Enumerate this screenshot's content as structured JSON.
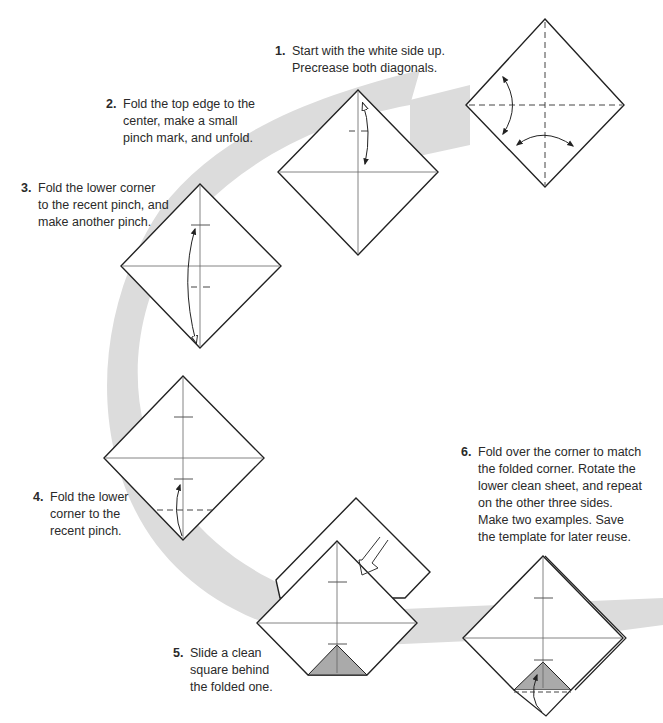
{
  "page": {
    "background": "#ffffff",
    "band_color": "#dcdcdc",
    "line_color": "#222222",
    "crease_color": "#555555",
    "shade_color": "#aaaaaa"
  },
  "steps": [
    {
      "number": "1.",
      "lines": [
        "Start with the white side up.",
        "Precrease both diagonals."
      ]
    },
    {
      "number": "2.",
      "lines": [
        "Fold the top edge to the",
        "center, make a small",
        "pinch mark, and unfold."
      ]
    },
    {
      "number": "3.",
      "lines": [
        "Fold the lower corner",
        "to the recent pinch, and",
        "make another pinch."
      ]
    },
    {
      "number": "4.",
      "lines": [
        "Fold the lower",
        "corner to the",
        "recent pinch."
      ]
    },
    {
      "number": "5.",
      "lines": [
        "Slide a clean",
        "square behind",
        "the folded one."
      ]
    },
    {
      "number": "6.",
      "lines": [
        "Fold over the corner to match",
        "the folded corner. Rotate the",
        "lower clean sheet, and repeat",
        "on the other three sides.",
        "Make two examples. Save",
        "the template for later reuse."
      ]
    }
  ]
}
